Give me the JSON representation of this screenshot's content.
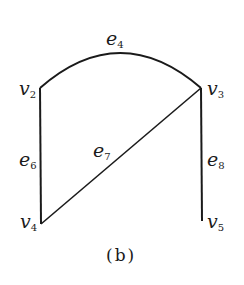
{
  "diagram": {
    "caption": "(b)",
    "stroke_color": "#1a1a1a",
    "vertices": [
      {
        "id": "v2",
        "base": "v",
        "sub": "2"
      },
      {
        "id": "v3",
        "base": "v",
        "sub": "3"
      },
      {
        "id": "v4",
        "base": "v",
        "sub": "4"
      },
      {
        "id": "v5",
        "base": "v",
        "sub": "5"
      }
    ],
    "edges": [
      {
        "id": "e4",
        "base": "e",
        "sub": "4",
        "from": "v2",
        "to": "v3",
        "shape": "arc"
      },
      {
        "id": "e6",
        "base": "e",
        "sub": "6",
        "from": "v2",
        "to": "v4",
        "shape": "line"
      },
      {
        "id": "e7",
        "base": "e",
        "sub": "7",
        "from": "v3",
        "to": "v4",
        "shape": "line"
      },
      {
        "id": "e8",
        "base": "e",
        "sub": "8",
        "from": "v3",
        "to": "v5",
        "shape": "line"
      }
    ]
  }
}
